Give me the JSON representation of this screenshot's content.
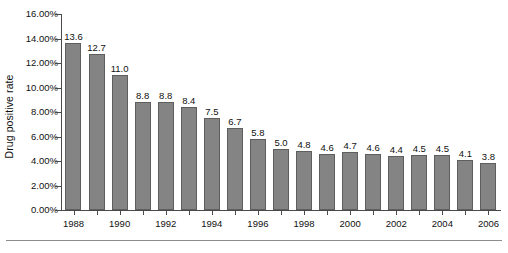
{
  "chart_data": {
    "type": "bar",
    "title": "",
    "xlabel": "",
    "ylabel": "Drug positive rate",
    "ylim": [
      0,
      16
    ],
    "ytick_labels": [
      "16.00%",
      "14.00%",
      "12.00%",
      "10.00%",
      "8.00%",
      "6.00%",
      "4.00%",
      "2.00%",
      "0.00%"
    ],
    "ytick_values": [
      16,
      14,
      12,
      10,
      8,
      6,
      4,
      2,
      0
    ],
    "grid": false,
    "legend": "none",
    "categories": [
      "1988",
      "1989",
      "1990",
      "1991",
      "1992",
      "1993",
      "1994",
      "1995",
      "1996",
      "1997",
      "1998",
      "1999",
      "2000",
      "2001",
      "2002",
      "2003",
      "2004",
      "2005",
      "2006"
    ],
    "xtick_labels_shown": [
      "1988",
      "1990",
      "1992",
      "1994",
      "1996",
      "1998",
      "2000",
      "2002",
      "2004",
      "2006"
    ],
    "values": [
      13.6,
      12.7,
      11.0,
      8.8,
      8.8,
      8.4,
      7.5,
      6.7,
      5.8,
      5.0,
      4.8,
      4.6,
      4.7,
      4.6,
      4.4,
      4.5,
      4.5,
      4.1,
      3.8
    ],
    "data_labels": [
      "13.6",
      "12.7",
      "11.0",
      "8.8",
      "8.8",
      "8.4",
      "7.5",
      "6.7",
      "5.8",
      "5.0",
      "4.8",
      "4.6",
      "4.7",
      "4.6",
      "4.4",
      "4.5",
      "4.5",
      "4.1",
      "3.8"
    ],
    "bar_color": "#848484",
    "bar_edge_color": "#5e5e5e",
    "axis_color": "#4a4a4a",
    "text_color": "#111111"
  }
}
